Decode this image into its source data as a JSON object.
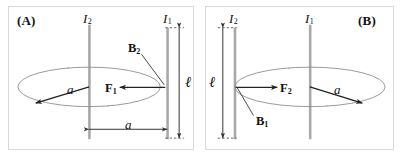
{
  "figure": {
    "type": "physics-diagram",
    "width": 402,
    "height": 156,
    "colors": {
      "background": "#ffffff",
      "panel_border": "#d8d8d8",
      "wire": "#a8a8a8",
      "loop": "#8d8d8d",
      "vector": "#222222",
      "dimension": "#333333",
      "text": "#111111"
    }
  },
  "panels": [
    {
      "id": "A",
      "tag": "(A)",
      "labels": {
        "current_left": {
          "symbol": "I",
          "sub": "2"
        },
        "current_right": {
          "symbol": "I",
          "sub": "1"
        },
        "field_vector": {
          "symbol": "B",
          "sub": "2"
        },
        "force_vector": {
          "symbol": "F",
          "sub": "1"
        },
        "radius": "a",
        "separation": "a",
        "length": "ℓ"
      },
      "notes": {
        "loop_center_wire": "I2 (left wire)",
        "force_direction": "leftward, from wire I1 toward wire I2",
        "field_direction": "at wire I1, pointing down-left (into loop plane region)",
        "length_dimension_side": "right",
        "separation_dimension": "bottom, between the two wires"
      }
    },
    {
      "id": "B",
      "tag": "(B)",
      "labels": {
        "current_left": {
          "symbol": "I",
          "sub": "2"
        },
        "current_right": {
          "symbol": "I",
          "sub": "1"
        },
        "field_vector": {
          "symbol": "B",
          "sub": "1"
        },
        "force_vector": {
          "symbol": "F",
          "sub": "2"
        },
        "radius": "a",
        "length": "ℓ"
      },
      "notes": {
        "loop_center_wire": "I1 (right wire)",
        "force_direction": "rightward, from wire I2 toward wire I1",
        "field_direction": "at wire I2, pointing down-left",
        "length_dimension_side": "left"
      }
    }
  ]
}
